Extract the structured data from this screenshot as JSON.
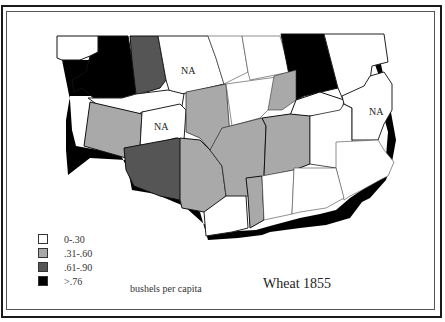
{
  "map": {
    "title": "Wheat 1855",
    "unit_label": "bushels per capita",
    "na_label": "NA",
    "colors": {
      "class_0": "#ffffff",
      "class_1": "#a9a9a9",
      "class_2": "#555555",
      "class_3": "#000000",
      "shadow": "#000000",
      "border": "#222222"
    }
  },
  "legend": {
    "items": [
      {
        "label": "0-.30",
        "color": "#ffffff"
      },
      {
        "label": ".31-.60",
        "color": "#a9a9a9"
      },
      {
        "label": ".61-.90",
        "color": "#555555"
      },
      {
        "label": ">.76",
        "color": "#000000"
      }
    ]
  },
  "na_regions": [
    {
      "label": "NA",
      "x": 190,
      "y": 72
    },
    {
      "label": "NA",
      "x": 162,
      "y": 128
    },
    {
      "label": "NA",
      "x": 377,
      "y": 113
    }
  ]
}
